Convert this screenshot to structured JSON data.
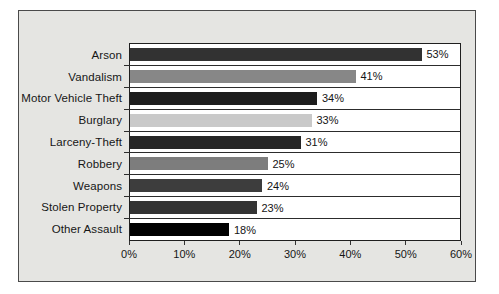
{
  "chart_data": {
    "type": "bar",
    "orientation": "horizontal",
    "categories": [
      "Arson",
      "Vandalism",
      "Motor Vehicle Theft",
      "Burglary",
      "Larceny-Theft",
      "Robbery",
      "Weapons",
      "Stolen Property",
      "Other Assault"
    ],
    "values": [
      53,
      41,
      34,
      33,
      31,
      25,
      24,
      23,
      18
    ],
    "value_labels": [
      "53%",
      "41%",
      "34%",
      "33%",
      "31%",
      "25%",
      "24%",
      "23%",
      "18%"
    ],
    "bar_colors": [
      "#323232",
      "#878787",
      "#1d1d1d",
      "#c9c9c9",
      "#262626",
      "#7d7d7d",
      "#3d3d3d",
      "#343434",
      "#000000"
    ],
    "xlim": [
      0,
      60
    ],
    "x_ticks": [
      "0%",
      "10%",
      "20%",
      "30%",
      "40%",
      "50%",
      "60%"
    ],
    "grid": "row-separator-lines",
    "legend": "none"
  },
  "colors": {
    "panel_bg": "#e5e5e2",
    "panel_border": "#4a4a4a",
    "plot_bg": "#ffffff",
    "plot_border": "#1f1f1f",
    "row_separator": "#2c2c2c",
    "text": "#161616"
  }
}
